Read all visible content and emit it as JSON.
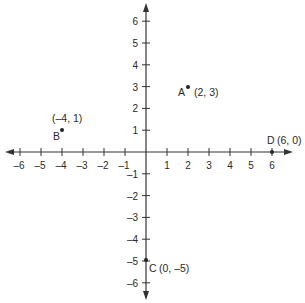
{
  "diagram": {
    "type": "coordinate-plane",
    "axis_color": "#333333",
    "x_range": [
      -6,
      6
    ],
    "y_range": [
      -6,
      6
    ],
    "x_tick_labels": [
      "–6",
      "–5",
      "–4",
      "–3",
      "–2",
      "–1",
      "1",
      "2",
      "3",
      "4",
      "5",
      "6"
    ],
    "y_tick_labels": [
      "6",
      "5",
      "4",
      "3",
      "2",
      "1",
      "–1",
      "–2",
      "–3",
      "–4",
      "–5",
      "–6"
    ],
    "points": [
      {
        "name": "A",
        "coords_label": "(2, 3)",
        "x": 2,
        "y": 3
      },
      {
        "name": "B",
        "coords_label": "(–4, 1)",
        "x": -4,
        "y": 1
      },
      {
        "name": "C",
        "coords_label": "(0, –5)",
        "x": 0,
        "y": -5
      },
      {
        "name": "D",
        "coords_label": "(6, 0)",
        "x": 6,
        "y": 0
      }
    ]
  }
}
